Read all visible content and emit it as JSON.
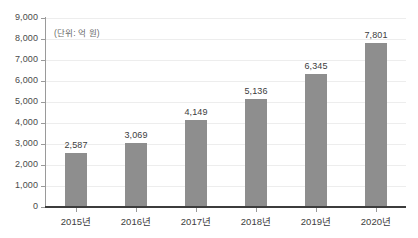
{
  "chart_data": {
    "type": "bar",
    "title": "",
    "subtitle": "",
    "unit_label": "(단위: 억 원)",
    "xlabel": "",
    "ylabel": "",
    "categories": [
      "2015년",
      "2016년",
      "2017년",
      "2018년",
      "2019년",
      "2020년"
    ],
    "values": [
      2587,
      3069,
      4149,
      5136,
      6345,
      7801
    ],
    "value_labels": [
      "2,587",
      "3,069",
      "4,149",
      "5,136",
      "6,345",
      "7,801"
    ],
    "ylim": [
      0,
      9000
    ],
    "ytick_values": [
      0,
      1000,
      2000,
      3000,
      4000,
      5000,
      6000,
      7000,
      8000,
      9000
    ],
    "ytick_labels": [
      "0",
      "1,000",
      "2,000",
      "3,000",
      "4,000",
      "5,000",
      "6,000",
      "7,000",
      "8,000",
      "9,000"
    ],
    "grid": true,
    "legend": false,
    "legend_position": "none",
    "bar_color": "#8e8e8e",
    "gridline_color": "#ededed",
    "axis_color": "#3c3c3c",
    "background_color": "#ffffff"
  }
}
